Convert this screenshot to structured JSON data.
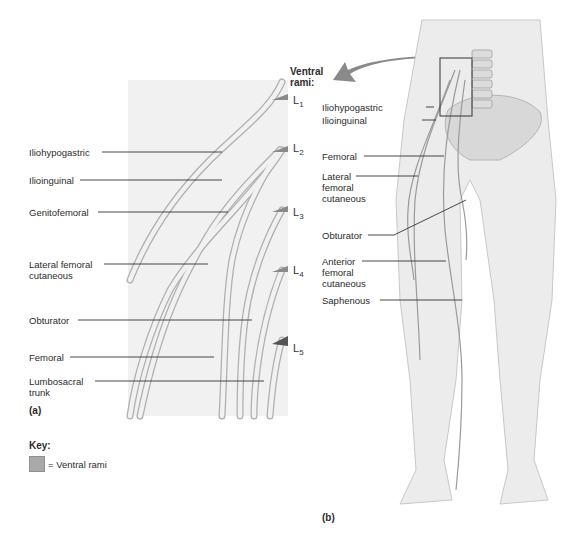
{
  "panel_a": {
    "caption": "(a)",
    "header": "Ventral rami:",
    "header_line1": "Ventral",
    "header_line2": "rami:",
    "levels": [
      {
        "name": "L",
        "sub": "1"
      },
      {
        "name": "L",
        "sub": "2"
      },
      {
        "name": "L",
        "sub": "3"
      },
      {
        "name": "L",
        "sub": "4"
      },
      {
        "name": "L",
        "sub": "5"
      }
    ],
    "labels": [
      {
        "text": "Iliohypogastric"
      },
      {
        "text": "Ilioinguinal"
      },
      {
        "text": "Genitofemoral"
      },
      {
        "text": "Lateral femoral cutaneous",
        "line1": "Lateral femoral",
        "line2": "cutaneous"
      },
      {
        "text": "Obturator"
      },
      {
        "text": "Femoral"
      },
      {
        "text": "Lumbosacral trunk",
        "line1": "Lumbosacral",
        "line2": "trunk"
      }
    ]
  },
  "panel_b": {
    "caption": "(b)",
    "labels": [
      {
        "text": "Iliohypogastric"
      },
      {
        "text": "Ilioinguinal"
      },
      {
        "text": "Femoral"
      },
      {
        "text": "Lateral femoral cutaneous",
        "line1": "Lateral",
        "line2": "femoral",
        "line3": "cutaneous"
      },
      {
        "text": "Obturator"
      },
      {
        "text": "Anterior femoral cutaneous",
        "line1": "Anterior",
        "line2": "femoral",
        "line3": "cutaneous"
      },
      {
        "text": "Saphenous"
      }
    ]
  },
  "key": {
    "title": "Key:",
    "items": [
      {
        "label": "= Ventral rami",
        "color": "#a9a9a9"
      }
    ]
  },
  "colors": {
    "nerve_fill": "#e6e6e6",
    "nerve_stroke": "#9a9a9a",
    "panel_bg": "#f2f2f2",
    "body_fill": "#ececec",
    "arrow": "#8a8a8a",
    "leader": "#333333"
  }
}
